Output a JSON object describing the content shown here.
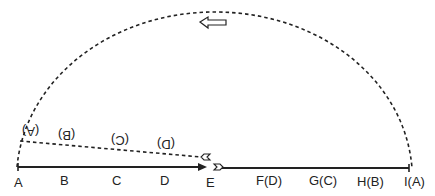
{
  "diagram": {
    "baseline_labels": [
      {
        "text": "A",
        "x": 14,
        "y": 176
      },
      {
        "text": "B",
        "x": 60,
        "y": 174
      },
      {
        "text": "C",
        "x": 112,
        "y": 174
      },
      {
        "text": "D",
        "x": 160,
        "y": 174
      },
      {
        "text": "E",
        "x": 206,
        "y": 176
      },
      {
        "text": "F(D)",
        "x": 256,
        "y": 174
      },
      {
        "text": "G(C)",
        "x": 309,
        "y": 174
      },
      {
        "text": "H(B)",
        "x": 357,
        "y": 175
      },
      {
        "text": "I(A)",
        "x": 404,
        "y": 175
      }
    ],
    "inverted_labels": [
      {
        "text": "(A)",
        "x": 22,
        "y": 125
      },
      {
        "text": "(B)",
        "x": 58,
        "y": 129
      },
      {
        "text": "(C)",
        "x": 111,
        "y": 134
      },
      {
        "text": "(D)",
        "x": 157,
        "y": 138
      }
    ],
    "direction_arrow": "left-arrow"
  }
}
